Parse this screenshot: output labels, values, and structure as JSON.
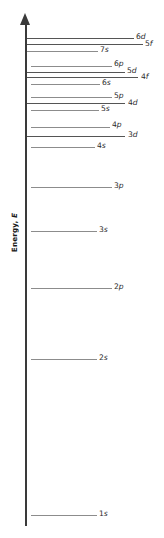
{
  "figure": {
    "axis": {
      "label_text": "Energy, ",
      "label_italic": "E",
      "arrow": "up-arrow",
      "direction": "increasing upward"
    }
  },
  "chart_data": {
    "type": "line",
    "xlabel": "",
    "ylabel": "Energy, E",
    "grid": false,
    "legend": null,
    "categories": [
      "1s",
      "2s",
      "2p",
      "3s",
      "3p",
      "4s",
      "3d",
      "4p",
      "5s",
      "4d",
      "5p",
      "6s",
      "4f",
      "5d",
      "6p",
      "7s",
      "5f",
      "6d"
    ],
    "values": [
      515,
      359,
      288,
      231,
      187,
      147,
      136,
      127,
      110,
      103,
      97,
      84,
      76,
      72,
      66,
      51,
      44,
      38
    ],
    "levels": [
      {
        "label": "6d",
        "sublabel": "",
        "y": 38,
        "x_start": 27,
        "x_end": 134,
        "label_x": 136,
        "label_y": 33,
        "weight": "dark"
      },
      {
        "label": "5f",
        "sublabel": "",
        "y": 44,
        "x_start": 27,
        "x_end": 143,
        "label_x": 145,
        "label_y": 40,
        "weight": "dark"
      },
      {
        "label": "7s",
        "sublabel": "",
        "y": 51,
        "x_start": 27,
        "x_end": 98,
        "label_x": 100,
        "label_y": 46,
        "weight": "light"
      },
      {
        "label": "6p",
        "sublabel": "",
        "y": 66,
        "x_start": 31,
        "x_end": 112,
        "label_x": 114,
        "label_y": 60,
        "weight": "light"
      },
      {
        "label": "5d",
        "sublabel": "",
        "y": 72,
        "x_start": 27,
        "x_end": 125,
        "label_x": 127,
        "label_y": 67,
        "weight": "dark"
      },
      {
        "label": "4f",
        "sublabel": "",
        "y": 77,
        "x_start": 27,
        "x_end": 138,
        "label_x": 141,
        "label_y": 73,
        "weight": "dark"
      },
      {
        "label": "6s",
        "sublabel": "",
        "y": 84,
        "x_start": 31,
        "x_end": 100,
        "label_x": 102,
        "label_y": 79,
        "weight": "light"
      },
      {
        "label": "5p",
        "sublabel": "",
        "y": 97,
        "x_start": 31,
        "x_end": 112,
        "label_x": 114,
        "label_y": 92,
        "weight": "light"
      },
      {
        "label": "4d",
        "sublabel": "",
        "y": 103,
        "x_start": 27,
        "x_end": 125,
        "label_x": 128,
        "label_y": 99,
        "weight": "dark"
      },
      {
        "label": "5s",
        "sublabel": "",
        "y": 110,
        "x_start": 31,
        "x_end": 99,
        "label_x": 101,
        "label_y": 105,
        "weight": "light"
      },
      {
        "label": "4p",
        "sublabel": "",
        "y": 127,
        "x_start": 31,
        "x_end": 110,
        "label_x": 112,
        "label_y": 121,
        "weight": "light"
      },
      {
        "label": "3d",
        "sublabel": "",
        "y": 136,
        "x_start": 27,
        "x_end": 125,
        "label_x": 128,
        "label_y": 131,
        "weight": "dark"
      },
      {
        "label": "4s",
        "sublabel": "",
        "y": 147,
        "x_start": 31,
        "x_end": 95,
        "label_x": 97,
        "label_y": 142,
        "weight": "light"
      },
      {
        "label": "3p",
        "sublabel": "",
        "y": 187,
        "x_start": 31,
        "x_end": 112,
        "label_x": 114,
        "label_y": 182,
        "weight": "light"
      },
      {
        "label": "3s",
        "sublabel": "",
        "y": 231,
        "x_start": 31,
        "x_end": 97,
        "label_x": 99,
        "label_y": 226,
        "weight": "light"
      },
      {
        "label": "2p",
        "sublabel": "",
        "y": 288,
        "x_start": 31,
        "x_end": 112,
        "label_x": 114,
        "label_y": 283,
        "weight": "light"
      },
      {
        "label": "2s",
        "sublabel": "",
        "y": 359,
        "x_start": 31,
        "x_end": 97,
        "label_x": 99,
        "label_y": 354,
        "weight": "light"
      },
      {
        "label": "1s",
        "sublabel": "",
        "y": 515,
        "x_start": 31,
        "x_end": 97,
        "label_x": 99,
        "label_y": 510,
        "weight": "light"
      }
    ]
  },
  "colors": {
    "background": "#ffffff",
    "axis": "#3a3a3a",
    "level_light": "#8c8c8c",
    "level_dark": "#555555",
    "text": "#2b2b2b"
  }
}
